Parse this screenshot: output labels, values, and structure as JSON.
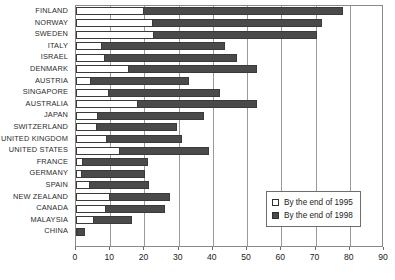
{
  "chart_data": {
    "type": "bar",
    "orientation": "horizontal",
    "title": "",
    "xlabel": "",
    "ylabel": "",
    "xlim": [
      0,
      90
    ],
    "xticks": [
      0,
      10,
      20,
      30,
      40,
      50,
      60,
      70,
      80,
      90
    ],
    "grid": true,
    "legend_position": "bottom-right",
    "categories": [
      "FINLAND",
      "NORWAY",
      "SWEDEN",
      "ITALY",
      "ISRAEL",
      "DENMARK",
      "AUSTRIA",
      "SINGAPORE",
      "AUSTRALIA",
      "JAPAN",
      "SWITZERLAND",
      "UNITED KINGDOM",
      "UNITED STATES",
      "FRANCE",
      "GERMANY",
      "SPAIN",
      "NEW ZEALAND",
      "CANADA",
      "MALAYSIA",
      "CHINA"
    ],
    "series": [
      {
        "name": "By the end of 1995",
        "color": "#ffffff",
        "values": [
          20.0,
          22.5,
          22.7,
          7.5,
          8.5,
          15.5,
          4.5,
          9.5,
          18.0,
          6.5,
          6.0,
          9.0,
          13.0,
          2.0,
          1.8,
          4.0,
          10.0,
          8.7,
          5.3,
          0.6
        ]
      },
      {
        "name": "By the end of 1998",
        "color": "#4a4a4a",
        "values": [
          78.0,
          72.0,
          70.5,
          43.5,
          47.0,
          53.0,
          33.0,
          42.0,
          53.0,
          37.5,
          29.5,
          31.0,
          39.0,
          21.0,
          20.3,
          21.3,
          27.5,
          26.0,
          16.3,
          2.6
        ]
      }
    ]
  },
  "legend": {
    "items": [
      {
        "label": "By the end of 1995",
        "swatch": "white-square-icon"
      },
      {
        "label": "By the end of 1998",
        "swatch": "dark-square-icon"
      }
    ]
  }
}
